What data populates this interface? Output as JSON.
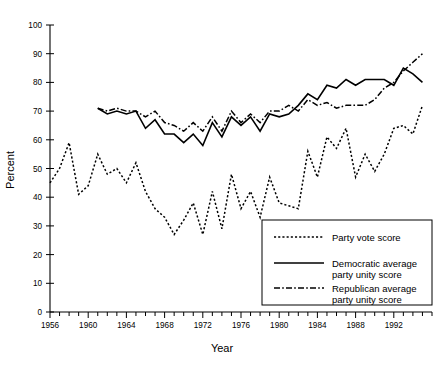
{
  "chart_data": {
    "type": "line",
    "title": "",
    "xlabel": "Year",
    "ylabel": "Percent",
    "xlim": [
      1956,
      1996
    ],
    "ylim": [
      0,
      100
    ],
    "grid": false,
    "legend_position": "bottom-right",
    "y_ticks": [
      0,
      10,
      20,
      30,
      40,
      50,
      60,
      70,
      80,
      90,
      100
    ],
    "y_tick_labels": [
      "0",
      "10",
      "20",
      "30",
      "40",
      "50",
      "60",
      "70",
      "80",
      "90",
      "100"
    ],
    "x_ticks": [
      1956,
      1960,
      1964,
      1968,
      1972,
      1976,
      1980,
      1984,
      1988,
      1992
    ],
    "x_tick_labels": [
      "1956",
      "1960",
      "1964",
      "1968",
      "1972",
      "1976",
      "1980",
      "1984",
      "1988",
      "1992"
    ],
    "x_minor_tick_step": 1,
    "series": [
      {
        "name": "Party vote score",
        "style": "dotted",
        "x": [
          1956,
          1957,
          1958,
          1959,
          1960,
          1961,
          1962,
          1963,
          1964,
          1965,
          1966,
          1967,
          1968,
          1969,
          1970,
          1971,
          1972,
          1973,
          1974,
          1975,
          1976,
          1977,
          1978,
          1979,
          1980,
          1981,
          1982,
          1983,
          1984,
          1985,
          1986,
          1987,
          1988,
          1989,
          1990,
          1991,
          1992,
          1993,
          1994,
          1995
        ],
        "values": [
          45,
          50,
          59,
          41,
          44,
          55,
          48,
          50,
          45,
          52,
          42,
          36,
          33,
          27,
          32,
          38,
          27,
          42,
          29,
          48,
          36,
          42,
          33,
          47,
          38,
          37,
          36,
          56,
          47,
          61,
          57,
          64,
          47,
          55,
          49,
          55,
          64,
          65,
          62,
          72
        ]
      },
      {
        "name": "Democratic average party unity score",
        "style": "solid",
        "x": [
          1961,
          1962,
          1963,
          1964,
          1965,
          1966,
          1967,
          1968,
          1969,
          1970,
          1971,
          1972,
          1973,
          1974,
          1975,
          1976,
          1977,
          1978,
          1979,
          1980,
          1981,
          1982,
          1983,
          1984,
          1985,
          1986,
          1987,
          1988,
          1989,
          1990,
          1991,
          1992,
          1993,
          1994,
          1995
        ],
        "values": [
          71,
          69,
          70,
          69,
          70,
          64,
          67,
          62,
          62,
          59,
          62,
          58,
          66,
          61,
          68,
          65,
          68,
          63,
          69,
          68,
          69,
          72,
          76,
          74,
          79,
          78,
          81,
          79,
          81,
          81,
          81,
          79,
          85,
          83,
          80
        ]
      },
      {
        "name": "Republican average party unity score",
        "style": "dash-dot",
        "x": [
          1961,
          1962,
          1963,
          1964,
          1965,
          1966,
          1967,
          1968,
          1969,
          1970,
          1971,
          1972,
          1973,
          1974,
          1975,
          1976,
          1977,
          1978,
          1979,
          1980,
          1981,
          1982,
          1983,
          1984,
          1985,
          1986,
          1987,
          1988,
          1989,
          1990,
          1991,
          1992,
          1993,
          1994,
          1995
        ],
        "values": [
          71,
          70,
          71,
          70,
          70,
          68,
          70,
          66,
          65,
          63,
          66,
          63,
          68,
          63,
          70,
          66,
          69,
          66,
          70,
          70,
          72,
          70,
          74,
          72,
          73,
          71,
          72,
          72,
          72,
          74,
          78,
          80,
          84,
          87,
          90
        ]
      }
    ]
  },
  "legend": {
    "items": [
      {
        "label": "Party vote score",
        "label2": "",
        "style": "dotted"
      },
      {
        "label": "Democratic average",
        "label2": "party unity score",
        "style": "solid"
      },
      {
        "label": "Republican average",
        "label2": "party unity score",
        "style": "dash-dot"
      }
    ]
  },
  "colors": {
    "axis": "#000000",
    "series": "#000000",
    "background": "#ffffff"
  }
}
